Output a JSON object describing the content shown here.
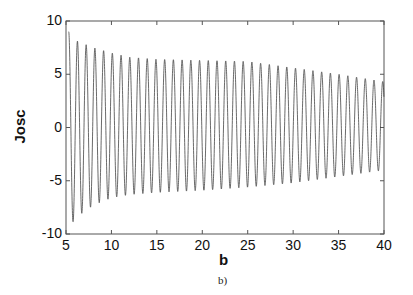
{
  "chart_data": {
    "type": "line",
    "title": "",
    "caption": "b)",
    "xlabel": "b",
    "ylabel": "Josc",
    "xlim": [
      5,
      40
    ],
    "ylim": [
      -10,
      10
    ],
    "xticks": [
      5,
      10,
      15,
      20,
      25,
      30,
      35,
      40
    ],
    "yticks": [
      10,
      5,
      0,
      -5,
      -10
    ],
    "grid": false,
    "legend": null,
    "series": [
      {
        "name": "Josc",
        "description": "Rapid sinusoidal oscillation (~37 cycles, period ≈ 0.96 in b) with slowly decaying amplitude envelope",
        "period": 0.96,
        "start_x": 5.3,
        "envelope_upper": {
          "x": [
            5.3,
            6,
            8,
            10,
            12,
            15,
            20,
            25,
            30,
            35,
            40
          ],
          "y": [
            9.0,
            8.2,
            7.5,
            7.0,
            6.6,
            6.4,
            6.3,
            6.2,
            5.6,
            5.0,
            4.3
          ]
        },
        "envelope_lower": {
          "x": [
            5.3,
            6,
            8,
            10,
            12,
            15,
            20,
            25,
            30,
            35,
            40
          ],
          "y": [
            -9.6,
            -8.5,
            -7.3,
            -6.6,
            -6.3,
            -6.1,
            -5.9,
            -5.6,
            -5.2,
            -4.6,
            -4.0
          ]
        }
      }
    ]
  }
}
